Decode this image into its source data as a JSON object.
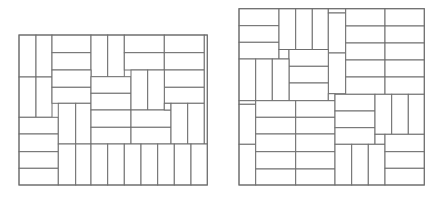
{
  "colors": {
    "background": "#ffffff",
    "line": "#6e6e6e"
  },
  "figures": [
    {
      "name": "left-tiling",
      "frame": [
        19,
        35,
        207.3,
        185
      ],
      "tiles": [
        [
          19,
          35,
          36,
          77
        ],
        [
          36,
          35,
          52,
          77
        ],
        [
          52,
          35,
          91,
          52.7
        ],
        [
          52,
          52.7,
          91,
          70
        ],
        [
          91,
          35,
          107.7,
          77
        ],
        [
          107.7,
          35,
          124.3,
          77
        ],
        [
          124.3,
          35,
          164.3,
          52.7
        ],
        [
          124.3,
          52.7,
          164.3,
          70
        ],
        [
          164.3,
          35,
          204.3,
          52.7
        ],
        [
          164.3,
          52.7,
          204.3,
          70
        ],
        [
          164.3,
          70,
          204.3,
          87.3
        ],
        [
          164.3,
          87.3,
          204.3,
          103.3
        ],
        [
          19,
          77,
          36,
          117.3
        ],
        [
          36,
          77,
          52,
          117.3
        ],
        [
          52,
          70,
          91,
          87.3
        ],
        [
          52,
          87.3,
          91,
          103.3
        ],
        [
          19,
          117.3,
          58.3,
          134
        ],
        [
          19,
          134,
          58.3,
          151.7
        ],
        [
          19,
          151.7,
          58.3,
          168.3
        ],
        [
          19,
          168.3,
          58.3,
          185
        ],
        [
          58.3,
          103.3,
          75.7,
          144
        ],
        [
          75.7,
          103.3,
          91,
          144
        ],
        [
          91,
          76.7,
          131,
          93.3
        ],
        [
          91,
          93.3,
          131,
          110
        ],
        [
          91,
          110,
          131,
          127.3
        ],
        [
          91,
          127.3,
          131,
          144
        ],
        [
          131,
          70,
          147.7,
          110
        ],
        [
          147.7,
          70,
          164.3,
          110
        ],
        [
          131,
          110,
          171,
          127.3
        ],
        [
          131,
          127.3,
          171,
          144
        ],
        [
          164.3,
          103.3,
          171,
          110
        ],
        [
          171,
          103.3,
          187.7,
          144
        ],
        [
          187.7,
          103.3,
          204.3,
          144
        ],
        [
          204.3,
          35,
          207.3,
          144
        ],
        [
          58.3,
          144,
          75.7,
          185
        ],
        [
          75.7,
          144,
          91,
          185
        ],
        [
          91,
          144,
          107.7,
          185
        ],
        [
          107.7,
          144,
          124.3,
          185
        ],
        [
          124.3,
          144,
          141,
          185
        ],
        [
          141,
          144,
          157.7,
          185
        ],
        [
          157.7,
          144,
          174.3,
          185
        ],
        [
          174.3,
          144,
          191,
          185
        ],
        [
          191,
          144,
          207.3,
          185
        ]
      ]
    },
    {
      "name": "right-tiling",
      "frame": [
        239,
        8.7,
        424.3,
        185
      ],
      "tiles": [
        [
          239,
          8.7,
          279,
          25.7
        ],
        [
          239,
          25.7,
          279,
          42.3
        ],
        [
          239,
          42.3,
          279,
          59
        ],
        [
          279,
          8.7,
          295.7,
          49.5
        ],
        [
          295.7,
          8.7,
          312.3,
          49.5
        ],
        [
          312.3,
          8.7,
          328.3,
          49.5
        ],
        [
          328.3,
          8.7,
          345.7,
          13
        ],
        [
          328.3,
          13,
          345.7,
          53
        ],
        [
          328.3,
          53,
          345.7,
          93.7
        ],
        [
          345.7,
          8.7,
          385,
          26
        ],
        [
          385,
          8.7,
          424.3,
          26
        ],
        [
          345.7,
          26,
          385,
          43
        ],
        [
          385,
          26,
          424.3,
          43
        ],
        [
          345.7,
          43,
          385,
          60
        ],
        [
          385,
          43,
          424.3,
          60
        ],
        [
          345.7,
          60,
          385,
          77
        ],
        [
          385,
          60,
          424.3,
          77
        ],
        [
          345.7,
          77,
          385,
          94.3
        ],
        [
          385,
          77,
          424.3,
          94.3
        ],
        [
          279,
          49.5,
          289,
          59
        ],
        [
          289,
          49.5,
          328.3,
          66.3
        ],
        [
          289,
          66.3,
          328.3,
          83
        ],
        [
          289,
          83,
          328.3,
          100.7
        ],
        [
          239,
          59,
          255.7,
          100.7
        ],
        [
          255.7,
          59,
          272.3,
          100.7
        ],
        [
          272.3,
          59,
          289,
          100.7
        ],
        [
          328.3,
          93.7,
          335,
          100.7
        ],
        [
          239,
          100.7,
          255.7,
          104.3
        ],
        [
          239,
          104.3,
          255.7,
          144.3
        ],
        [
          239,
          144.3,
          255.7,
          185
        ],
        [
          255.7,
          100.7,
          295.7,
          117.3
        ],
        [
          295.7,
          100.7,
          335,
          117.3
        ],
        [
          255.7,
          117.3,
          295.7,
          134
        ],
        [
          295.7,
          117.3,
          335,
          134
        ],
        [
          255.7,
          134,
          295.7,
          151.7
        ],
        [
          295.7,
          134,
          335,
          151.7
        ],
        [
          255.7,
          151.7,
          295.7,
          169
        ],
        [
          295.7,
          151.7,
          335,
          169
        ],
        [
          255.7,
          169,
          295.7,
          185
        ],
        [
          295.7,
          169,
          335,
          185
        ],
        [
          335,
          94.3,
          375,
          111
        ],
        [
          335,
          111,
          375,
          127.7
        ],
        [
          335,
          127.7,
          375,
          144.3
        ],
        [
          375,
          94.3,
          391.7,
          134.3
        ],
        [
          391.7,
          94.3,
          408.3,
          134.3
        ],
        [
          408.3,
          94.3,
          424.3,
          134.3
        ],
        [
          375,
          134.3,
          385,
          144.3
        ],
        [
          335,
          144.3,
          351.7,
          185
        ],
        [
          351.7,
          144.3,
          368.3,
          185
        ],
        [
          368.3,
          144.3,
          385,
          185
        ],
        [
          385,
          134.3,
          424.3,
          151.7
        ],
        [
          385,
          151.7,
          424.3,
          168.3
        ],
        [
          385,
          168.3,
          424.3,
          185
        ]
      ]
    }
  ]
}
